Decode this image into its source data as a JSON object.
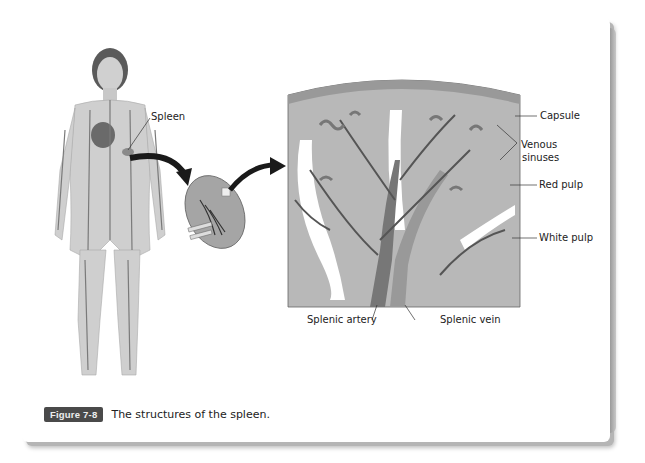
{
  "figure": {
    "number": "Figure 7-8",
    "caption": "The structures of the spleen."
  },
  "labels": {
    "spleen": "Spleen",
    "capsule": "Capsule",
    "venous_sinuses_line1": "Venous",
    "venous_sinuses_line2": "sinuses",
    "red_pulp": "Red pulp",
    "white_pulp": "White pulp",
    "splenic_artery": "Splenic artery",
    "splenic_vein": "Splenic vein"
  },
  "colors": {
    "badge_bg": "#4a4a4a",
    "tissue_gray": "#b4b4b4",
    "capsule_gray": "#9a9a9a",
    "vessel_dark": "#555555"
  }
}
